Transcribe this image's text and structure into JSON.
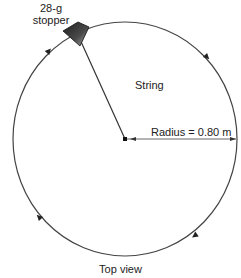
{
  "diagram": {
    "type": "top-view circular motion",
    "stopper_label_line1": "28-g",
    "stopper_label_line2": "stopper",
    "string_label": "String",
    "radius_label": "Radius = 0.80 m",
    "caption": "Top view",
    "direction": "clockwise",
    "arrow_count": 5,
    "colors": {
      "line": "#333333",
      "stopper_dark": "#2a2a2a",
      "stopper_light": "#9a9a9a"
    }
  }
}
